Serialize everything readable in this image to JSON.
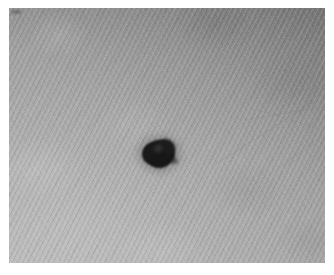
{
  "image": {
    "kind": "photograph",
    "modality": "clinical-macro-photography",
    "color_mode": "grayscale",
    "subject": "pigmented skin lesion",
    "caption": "",
    "canvas": {
      "width_px": 334,
      "height_px": 275,
      "background_color": "#ffffff"
    },
    "plate": {
      "left_px": 9,
      "top_px": 8,
      "width_px": 316,
      "height_px": 255,
      "border_color": "#ffffff",
      "border_width_px": 9
    }
  },
  "background": {
    "name": "skin-field",
    "base_color": "#9c9c9c",
    "tone_range": [
      "#7f7f7f",
      "#bdbdbd"
    ],
    "texture": "fine diagonal skin lines with cross-hatched weave",
    "stripe_angle_deg": 116,
    "cross_stripe_angle_deg": 56,
    "illumination": "brighter toward lower-left, darker toward upper-right corner"
  },
  "lesion": {
    "name": "pigmented-lesion",
    "label": "",
    "shape": "irregular multilobed round blob",
    "core_color": "#161616",
    "halo_color": "rgba(40,40,40,0.18)",
    "center_px": {
      "x": 158,
      "y": 152
    },
    "width_px": 31,
    "height_px": 27,
    "area_fraction_of_plate": 0.008,
    "border": "slightly blurred, soft irregular edge"
  },
  "artifacts": {
    "corner_mark": {
      "name": "corner-artifact",
      "position_px": {
        "x": 12,
        "y": 10
      },
      "width_px": 9,
      "height_px": 4,
      "color": "rgba(70,70,70,0.45)"
    },
    "scratches": [
      {
        "name": "scratch-line-1",
        "x1": 215,
        "y1": 165,
        "x2": 316,
        "y2": 100,
        "opacity": 0.18
      },
      {
        "name": "scratch-line-2",
        "x1": 245,
        "y1": 120,
        "x2": 316,
        "y2": 108,
        "opacity": 0.14
      },
      {
        "name": "scratch-line-3",
        "x1": 252,
        "y1": 108,
        "x2": 316,
        "y2": 128,
        "opacity": 0.12
      },
      {
        "name": "scratch-line-4",
        "x1": 268,
        "y1": 176,
        "x2": 316,
        "y2": 140,
        "opacity": 0.13
      }
    ]
  }
}
